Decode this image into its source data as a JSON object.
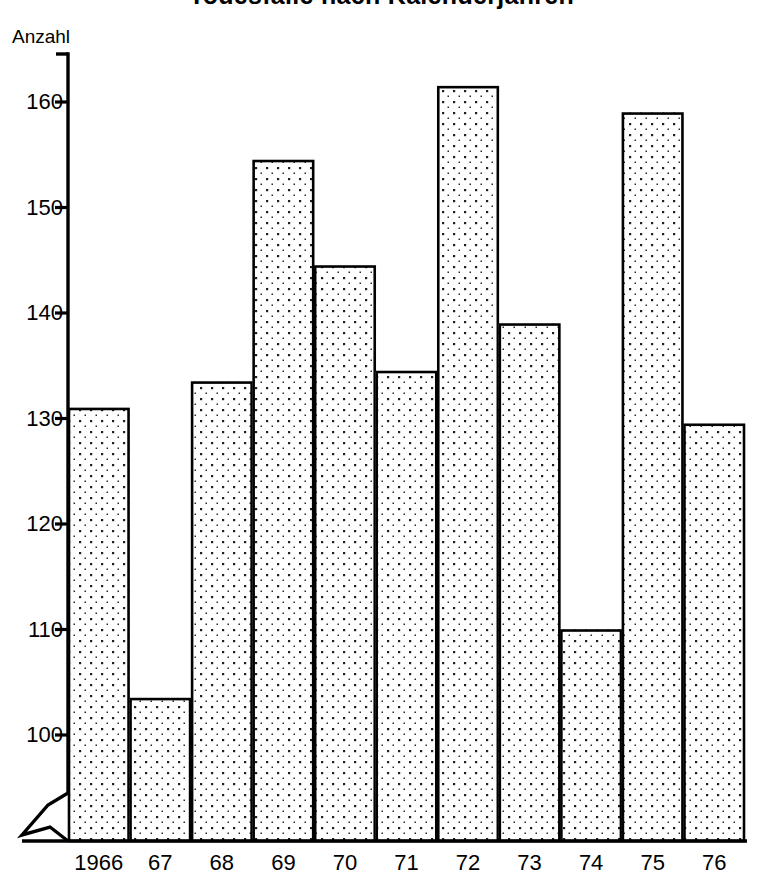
{
  "chart_data": {
    "type": "bar",
    "title": "Todesfälle nach Kalenderjahren",
    "ylabel": "Anzahl",
    "xlabel": "",
    "unit_caption": "Anzahl",
    "categories": [
      "1966",
      "67",
      "68",
      "69",
      "70",
      "71",
      "72",
      "73",
      "74",
      "75",
      "76"
    ],
    "values": [
      131,
      103.5,
      133.5,
      154.5,
      144.5,
      134.5,
      161.5,
      139,
      110,
      159,
      129.5
    ],
    "ytick_labels": [
      "160",
      "150",
      "140",
      "130",
      "120",
      "110",
      "100"
    ],
    "yticks": [
      160,
      150,
      140,
      130,
      120,
      110,
      100
    ],
    "ylim": [
      95,
      166
    ],
    "axis_break": true,
    "axis_break_note": "zigzag break on value axis below 100",
    "grid": false,
    "legend": null,
    "bar_fill": "dotted-stipple",
    "bar_fill_color": "#ffffff",
    "bar_dot_color": "#1a1a1a",
    "bar_stroke_color": "#000000",
    "axis_color": "#000000",
    "background_color": "#ffffff"
  },
  "plot_geometry": {
    "x_left": 68,
    "x_right": 745,
    "y_top_value": 160,
    "y_top_px": 102,
    "y_bottom_value": 100,
    "y_bottom_px": 735,
    "baseline_px": 841
  }
}
